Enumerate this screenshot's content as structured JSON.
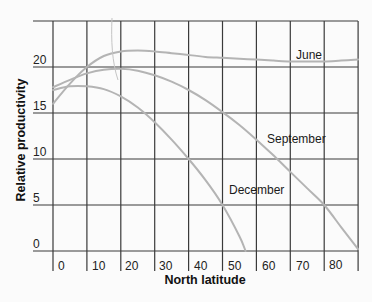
{
  "chart_data": {
    "type": "line",
    "title": "",
    "xlabel": "North latitude",
    "ylabel": "Relative productivity",
    "x_ticks": [
      0,
      10,
      20,
      30,
      40,
      50,
      60,
      70,
      80
    ],
    "y_ticks": [
      0,
      5,
      10,
      15,
      20
    ],
    "xlim": [
      0,
      90
    ],
    "ylim": [
      0,
      25
    ],
    "grid": true,
    "legend": "inline labels",
    "x": [
      0,
      5,
      10,
      15,
      20,
      25,
      30,
      35,
      40,
      45,
      50,
      55,
      60,
      65,
      70,
      75,
      80,
      85,
      90
    ],
    "series": [
      {
        "name": "June",
        "values": [
          16.0,
          18.2,
          20.0,
          21.2,
          21.7,
          21.8,
          21.7,
          21.5,
          21.3,
          21.1,
          21.0,
          20.9,
          20.8,
          20.7,
          20.6,
          20.6,
          20.6,
          20.7,
          20.8
        ]
      },
      {
        "name": "September",
        "values": [
          17.8,
          18.6,
          19.3,
          19.7,
          19.8,
          19.6,
          19.1,
          18.4,
          17.5,
          16.4,
          15.1,
          13.7,
          12.1,
          10.4,
          8.6,
          6.8,
          5.0,
          2.6,
          0.2
        ]
      },
      {
        "name": "December",
        "values": [
          17.5,
          17.9,
          17.9,
          17.6,
          16.8,
          15.6,
          14.0,
          12.1,
          10.0,
          7.7,
          5.0,
          1.6,
          null,
          null,
          null,
          null,
          null,
          null,
          null
        ]
      }
    ]
  },
  "labels": {
    "y_axis": "Relative productivity",
    "x_axis": "North latitude",
    "june": "June",
    "september": "September",
    "december": "December",
    "y_ticks": [
      "0",
      "5",
      "10",
      "15",
      "20"
    ],
    "x_ticks": [
      "0",
      "10",
      "20",
      "30",
      "40",
      "50",
      "60",
      "70",
      "80"
    ]
  }
}
